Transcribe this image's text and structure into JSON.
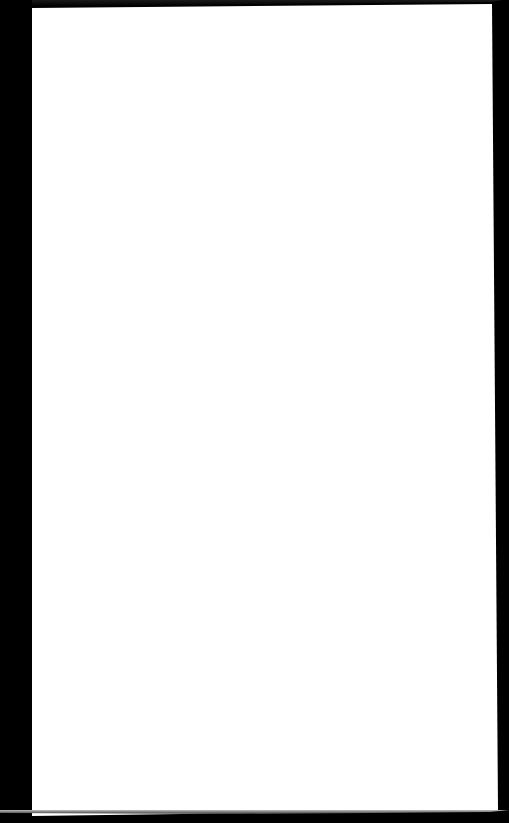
{
  "scene": {
    "description": "Blank white sheet of paper photographed on a black background",
    "background_color": "#000000",
    "paper_color": "#ffffff"
  },
  "page": {
    "text": ""
  }
}
